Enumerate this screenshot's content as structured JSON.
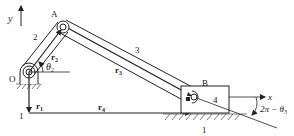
{
  "diagram": {
    "axes": {
      "x_label": "x",
      "y_label": "y"
    },
    "joints": {
      "O": "O",
      "A": "A",
      "B": "B"
    },
    "links": {
      "link1_top": "1",
      "link1_bottom": "1",
      "link2": "2",
      "link3": "3",
      "link4": "4"
    },
    "vectors": {
      "r1": "r",
      "r1_sub": "1",
      "r2": "r",
      "r2_sub": "2",
      "r3": "r",
      "r3_sub": "3",
      "r4": "r",
      "r4_sub": "4"
    },
    "angles": {
      "theta2": "θ",
      "theta2_sub": "2",
      "theta3_expr": "2π − θ",
      "theta3_sub": "3"
    },
    "colors": {
      "stroke": "#222222",
      "background": "#ffffff"
    }
  }
}
